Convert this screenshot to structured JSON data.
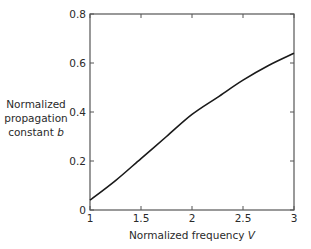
{
  "chart_data": {
    "type": "line",
    "title": "",
    "xlabel": "Normalized frequency V",
    "ylabel": "Normalized propagation constant b",
    "xlim": [
      1,
      3
    ],
    "ylim": [
      0,
      0.8
    ],
    "grid": false,
    "legend": null,
    "x_ticks": [
      1,
      1.5,
      2,
      2.5,
      3
    ],
    "x_tick_labels": [
      "1",
      "1.5",
      "2",
      "2.5",
      "3"
    ],
    "y_ticks": [
      0,
      0.2,
      0.4,
      0.6,
      0.8
    ],
    "y_tick_labels": [
      "0",
      "0.2",
      "0.4",
      "0.6",
      "0.8"
    ],
    "series": [
      {
        "name": "b(V)",
        "color": "#1a1a1a",
        "x": [
          1.0,
          1.25,
          1.5,
          1.75,
          2.0,
          2.25,
          2.5,
          2.75,
          3.0
        ],
        "y": [
          0.04,
          0.12,
          0.21,
          0.3,
          0.39,
          0.46,
          0.53,
          0.59,
          0.64
        ]
      }
    ]
  },
  "labels": {
    "ylabel_line1": "Normalized",
    "ylabel_line2": "propagation",
    "ylabel_line3_text": "constant ",
    "ylabel_line3_var": "b",
    "xlabel_text": "Normalized frequency ",
    "xlabel_var": "V"
  },
  "colors": {
    "axis": "#555555",
    "curve": "#1a1a1a",
    "text": "#2a2a2a"
  }
}
